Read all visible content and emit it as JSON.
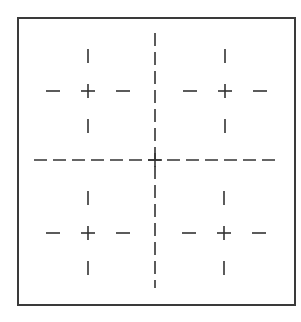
{
  "diagram": {
    "colors": {
      "background": "#ffffff",
      "stroke": "#333333",
      "frame": "#3a3a3a"
    },
    "frame": {
      "x": 18,
      "y": 18,
      "width": 277,
      "height": 287
    },
    "center_cross": {
      "x": 155,
      "y": 160,
      "vertical": {
        "y1": 33,
        "y2": 288,
        "dash": 13,
        "gap": 6
      },
      "horizontal": {
        "x1": 34,
        "x2": 279,
        "dash": 13,
        "gap": 6
      }
    },
    "crosshairs": [
      {
        "name": "top-left",
        "cx": 88,
        "cy": 91
      },
      {
        "name": "top-right",
        "cx": 225,
        "cy": 91
      },
      {
        "name": "bottom-left",
        "cx": 88,
        "cy": 233
      },
      {
        "name": "bottom-right",
        "cx": 224,
        "cy": 233
      }
    ],
    "crosshair_geometry": {
      "plus_arm": 7,
      "tick_length": 14,
      "tick_offset_inner": 28,
      "tick_offset_outer": 42
    }
  }
}
